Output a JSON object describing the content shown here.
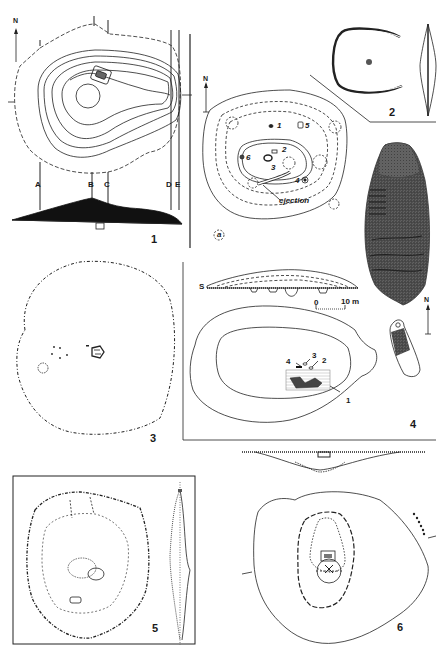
{
  "figure": {
    "panels": [
      {
        "id": "1",
        "label": "1",
        "content": "contour plan of mound with section lines and profile",
        "section_labels": [
          "A",
          "B",
          "C",
          "D",
          "E"
        ],
        "north": "N"
      },
      {
        "id": "2",
        "label": "2",
        "content": "horseshoe-shaped enclosure plan with side profile"
      },
      {
        "id": "2b",
        "label": "",
        "content": "plan with numbered features and pits",
        "north": "N",
        "features": [
          "1",
          "5",
          "2",
          "6",
          "3",
          "4"
        ],
        "annotation": "ejection",
        "legend_symbol_label": "a"
      },
      {
        "id": "stele",
        "label": "",
        "content": "carved anthropomorphic stele (stippled)"
      },
      {
        "id": "3",
        "label": "3",
        "content": "circular mound outline with central burial"
      },
      {
        "id": "4",
        "label": "4",
        "content": "mound plan and section with numbered features and stele",
        "section_label": "S",
        "features": [
          "4",
          "3",
          "2",
          "1"
        ],
        "scale": {
          "start": "0",
          "end": "10",
          "unit": "m"
        },
        "north": "N"
      },
      {
        "id": "5",
        "label": "5",
        "content": "stone ring plan with central cairn and profile"
      },
      {
        "id": "6",
        "label": "6",
        "content": "oval mound plan with central grave and section above"
      }
    ]
  },
  "labels": {
    "p1": "1",
    "p2": "2",
    "p3": "3",
    "p4": "4",
    "p5": "5",
    "p6": "6",
    "north": "N",
    "A": "A",
    "B": "B",
    "C": "C",
    "D": "D",
    "E": "E",
    "f1": "1",
    "f2": "2",
    "f3": "3",
    "f4": "4",
    "f5": "5",
    "f6": "6",
    "ejection": "ejection",
    "legend_a": "a",
    "S": "S",
    "p4f1": "1",
    "p4f2": "2",
    "p4f3": "3",
    "p4f4": "4",
    "scale_0": "0",
    "scale_10": "10 m"
  }
}
